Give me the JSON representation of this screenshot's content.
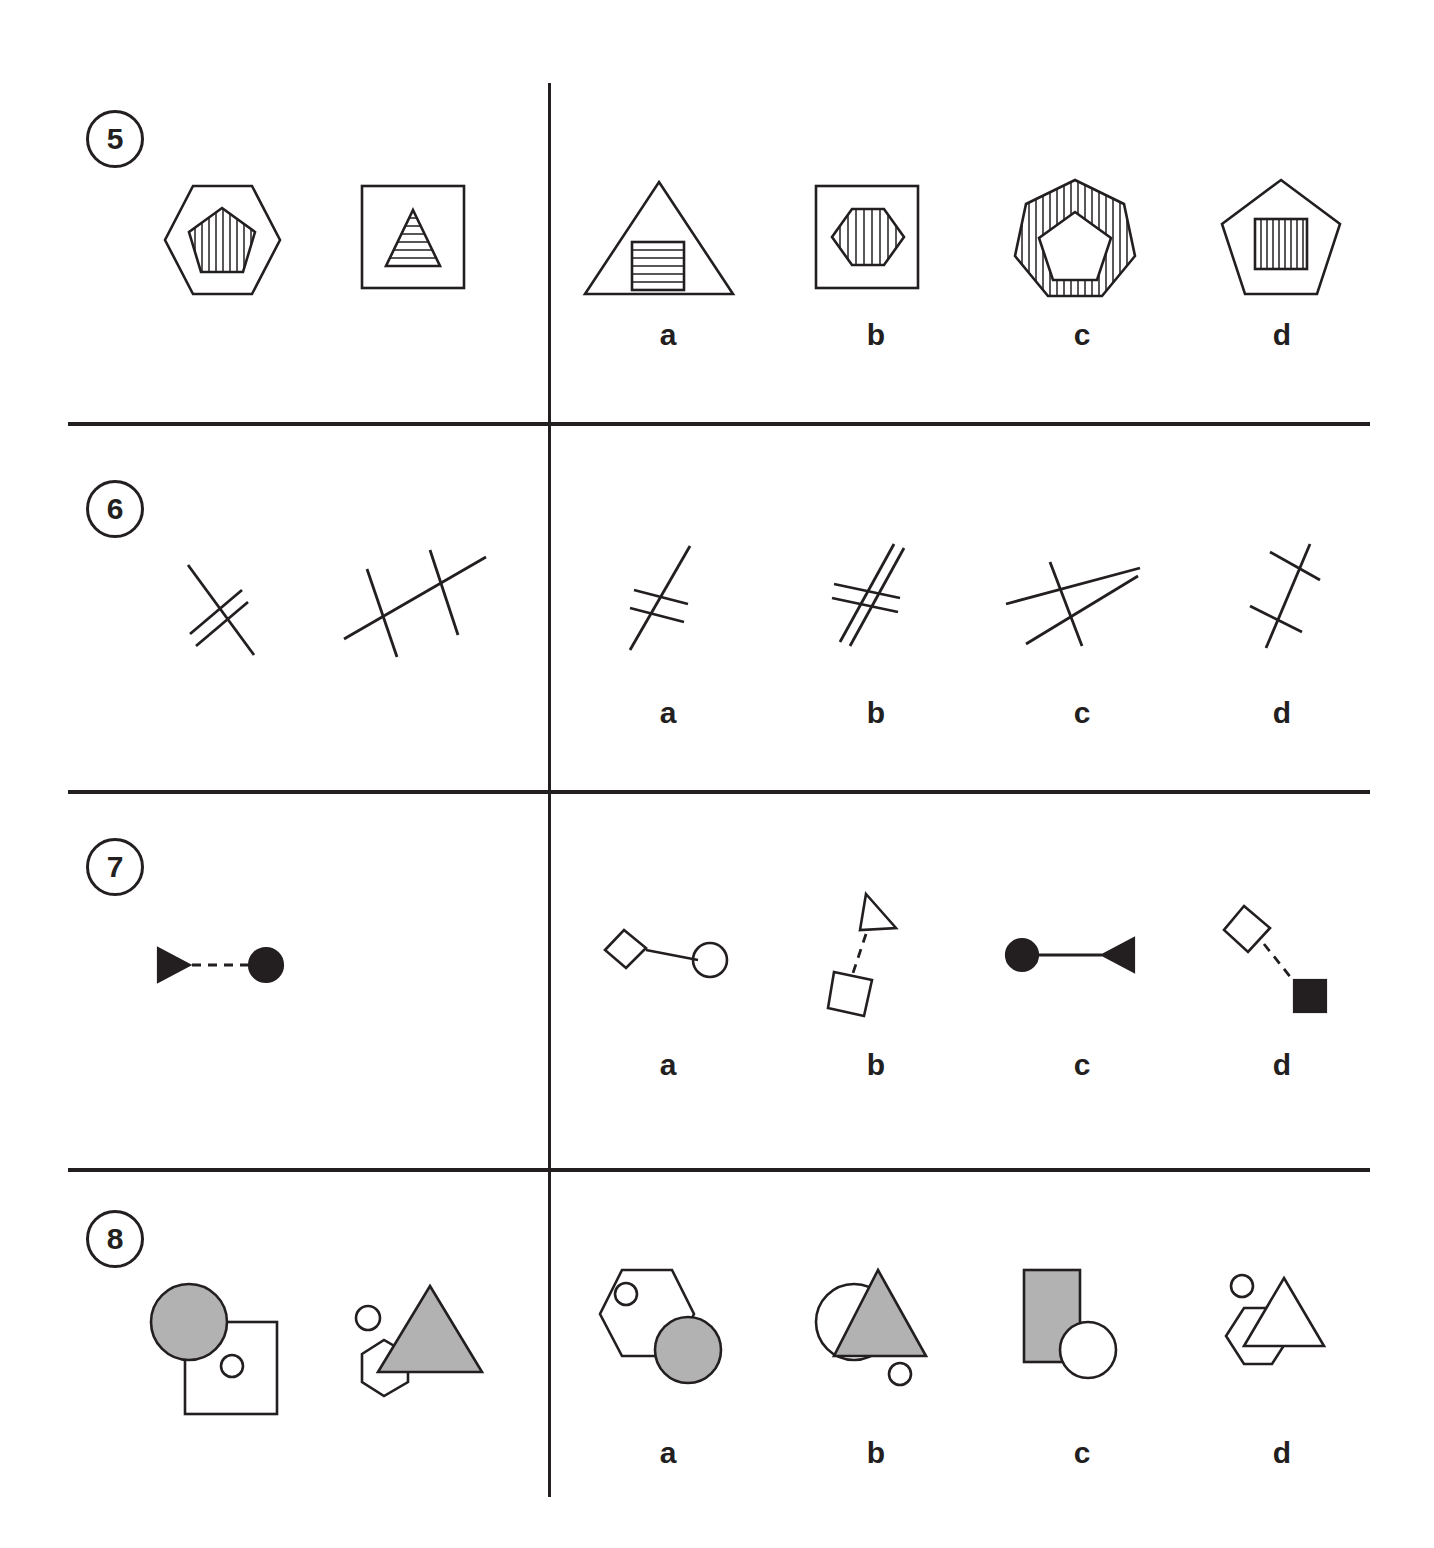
{
  "page": {
    "type": "non-verbal-reasoning-worksheet",
    "background_color": "#ffffff",
    "ink_color": "#231f20",
    "fill_gray": "#b2b2b2",
    "width": 1434,
    "height": 1548
  },
  "option_letters": [
    "a",
    "b",
    "c",
    "d"
  ],
  "questions": [
    {
      "number": "5",
      "number_label": "5",
      "prompt_figures": [
        {
          "name": "hexagon-with-striped-pentagon",
          "description": "plain hexagon outline containing a vertically striped pentagon"
        },
        {
          "name": "square-with-striped-triangle",
          "description": "plain square outline containing a horizontally striped triangle"
        }
      ],
      "options": [
        {
          "letter": "a",
          "name": "triangle-with-striped-square",
          "description": "triangle outline containing a horizontally striped square"
        },
        {
          "letter": "b",
          "name": "square-with-striped-hexagon",
          "description": "square outline containing a vertically striped hexagon"
        },
        {
          "letter": "c",
          "name": "striped-heptagon-with-plain-pentagon",
          "description": "vertically striped heptagon containing a plain white pentagon"
        },
        {
          "letter": "d",
          "name": "pentagon-with-striped-square",
          "description": "pentagon outline containing a vertically striped square"
        }
      ]
    },
    {
      "number": "6",
      "number_label": "6",
      "prompt_figures": [
        {
          "name": "long-line-with-two-short-crossings",
          "description": "one long diagonal line crossed by two short parallel lines"
        },
        {
          "name": "three-crossing-lines",
          "description": "one long shallow line crossed by two steep lines"
        }
      ],
      "options": [
        {
          "letter": "a",
          "name": "steep-line-with-two-short-crossings",
          "description": "one steep line crossed near its middle by two short parallel lines"
        },
        {
          "letter": "b",
          "name": "two-parallel-lines-with-two-crossings",
          "description": "two parallel steep lines crossed by two short parallel lines"
        },
        {
          "letter": "c",
          "name": "three-lines-triangular-crossing",
          "description": "three long lines crossing forming a narrow triangle"
        },
        {
          "letter": "d",
          "name": "steep-line-with-two-separated-crossings",
          "description": "one steep line crossed by two short lines at separated points"
        }
      ]
    },
    {
      "number": "7",
      "number_label": "7",
      "prompt_figures": [
        {
          "name": "solid-triangle-dashed-solid-circle",
          "description": "solid right-pointing triangle joined by a dashed line to a solid circle"
        },
        {
          "name": "outline-triangle-dashed-outline-diamond",
          "description": "outlined triangle joined by a dashed line to an outlined diamond"
        }
      ],
      "options": [
        {
          "letter": "a",
          "name": "outline-diamond-solid-line-outline-circle",
          "description": "outlined diamond joined by a solid line to an outlined circle"
        },
        {
          "letter": "b",
          "name": "outline-triangle-dashed-outline-square",
          "description": "outlined triangle joined by a dashed line to an outlined tilted square"
        },
        {
          "letter": "c",
          "name": "solid-circle-solid-line-solid-triangle",
          "description": "solid circle joined by a solid line to a solid left-pointing triangle"
        },
        {
          "letter": "d",
          "name": "outline-diamond-dashed-solid-square",
          "description": "outlined diamond joined by a dashed line to a solid square"
        }
      ]
    },
    {
      "number": "8",
      "number_label": "8",
      "prompt_figures": [
        {
          "name": "gray-circle-over-square-with-inner-circle",
          "description": "gray circle overlapping a white square that contains a small circle"
        },
        {
          "name": "gray-triangle-over-hexagon-with-outer-circle",
          "description": "gray triangle overlapping a white hexagon with a small circle outside"
        }
      ],
      "options": [
        {
          "letter": "a",
          "name": "hexagon-with-inner-circle-and-gray-circle",
          "description": "white hexagon containing a small circle, gray circle overlapping bottom right"
        },
        {
          "letter": "b",
          "name": "white-circle-gray-triangle-outer-circle",
          "description": "white circle overlapped by a gray triangle with a small circle outside"
        },
        {
          "letter": "c",
          "name": "gray-rectangle-with-white-circle",
          "description": "gray rectangle overlapped at bottom right by a white circle"
        },
        {
          "letter": "d",
          "name": "white-triangle-over-hexagon-outer-circle",
          "description": "white triangle overlapping a white hexagon with a small circle outside"
        }
      ]
    }
  ]
}
